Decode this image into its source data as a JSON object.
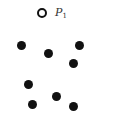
{
  "diagram": {
    "open_point": {
      "x": 42,
      "y": 13,
      "label": "P",
      "subscript": "1"
    },
    "filled_points": [
      {
        "x": 21,
        "y": 45
      },
      {
        "x": 48,
        "y": 53
      },
      {
        "x": 79,
        "y": 45
      },
      {
        "x": 73,
        "y": 63
      },
      {
        "x": 28,
        "y": 84
      },
      {
        "x": 56,
        "y": 96
      },
      {
        "x": 32,
        "y": 104
      },
      {
        "x": 73,
        "y": 106
      }
    ],
    "colors": {
      "point": "#111111",
      "background": "#ffffff"
    }
  }
}
